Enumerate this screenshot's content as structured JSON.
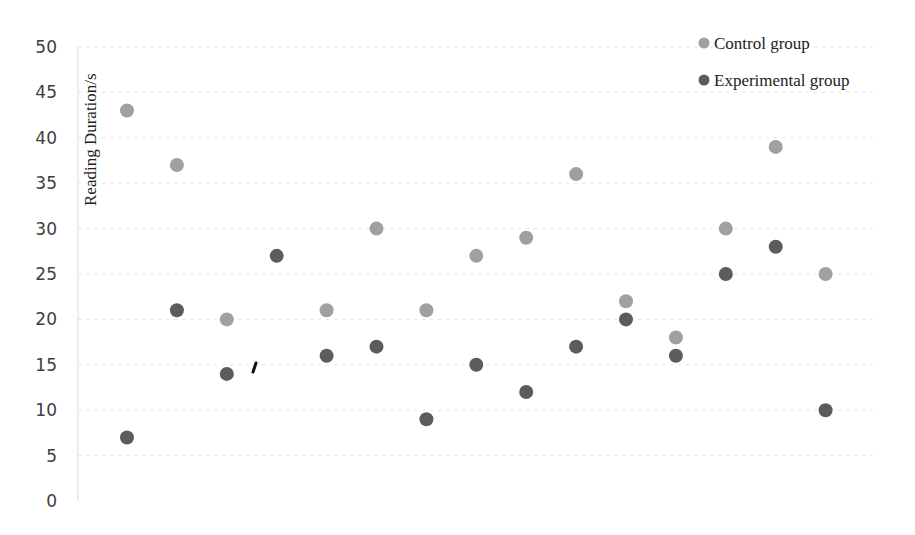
{
  "chart_data": {
    "type": "scatter",
    "title": "",
    "xlabel": "",
    "ylabel": "Reading Duration/s",
    "ylim": [
      0,
      50
    ],
    "yticks": [
      0,
      5,
      10,
      15,
      20,
      25,
      30,
      35,
      40,
      45,
      50
    ],
    "x": [
      1,
      2,
      3,
      4,
      5,
      6,
      7,
      8,
      9,
      10,
      11,
      12,
      13,
      14,
      15
    ],
    "xlim": [
      0,
      16
    ],
    "grid": true,
    "legend_position": "top-right",
    "series": [
      {
        "name": "Control group",
        "color": "#a0a0a0",
        "points": [
          {
            "x": 1,
            "y": 43
          },
          {
            "x": 2,
            "y": 37
          },
          {
            "x": 3,
            "y": 20
          },
          {
            "x": 5,
            "y": 21
          },
          {
            "x": 6,
            "y": 30
          },
          {
            "x": 7,
            "y": 21
          },
          {
            "x": 8,
            "y": 27
          },
          {
            "x": 9,
            "y": 29
          },
          {
            "x": 10,
            "y": 36
          },
          {
            "x": 11,
            "y": 22
          },
          {
            "x": 12,
            "y": 18
          },
          {
            "x": 13,
            "y": 30
          },
          {
            "x": 14,
            "y": 39
          },
          {
            "x": 15,
            "y": 25
          }
        ]
      },
      {
        "name": "Experimental group",
        "color": "#5c5c5c",
        "points": [
          {
            "x": 1,
            "y": 7
          },
          {
            "x": 2,
            "y": 21
          },
          {
            "x": 3,
            "y": 14
          },
          {
            "x": 4,
            "y": 27
          },
          {
            "x": 5,
            "y": 16
          },
          {
            "x": 6,
            "y": 17
          },
          {
            "x": 7,
            "y": 9
          },
          {
            "x": 8,
            "y": 15
          },
          {
            "x": 9,
            "y": 12
          },
          {
            "x": 10,
            "y": 17
          },
          {
            "x": 11,
            "y": 20
          },
          {
            "x": 12,
            "y": 16
          },
          {
            "x": 13,
            "y": 25
          },
          {
            "x": 14,
            "y": 28
          },
          {
            "x": 15,
            "y": 10
          }
        ]
      }
    ]
  },
  "legend": {
    "items": [
      {
        "label": "Control group",
        "color": "#a0a0a0"
      },
      {
        "label": "Experimental group",
        "color": "#5c5c5c"
      }
    ]
  },
  "axis": {
    "ylabel": "Reading Duration/s"
  }
}
